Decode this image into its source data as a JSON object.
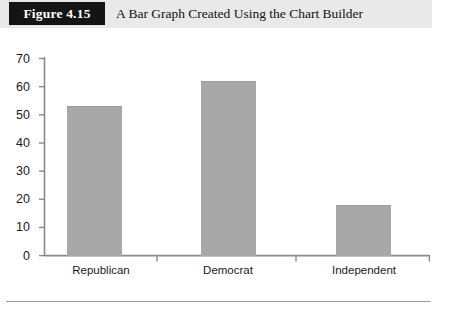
{
  "figure": {
    "number_label": "Figure 4.15",
    "title": "A Bar Graph Created Using the Chart Builder"
  },
  "colors": {
    "header_band": "#e9e9e9",
    "number_box": "#141414",
    "number_text": "#ffffff",
    "bar_fill": "#a8a8a8",
    "axis": "#808080",
    "text": "#1a1a1a"
  },
  "chart_data": {
    "type": "bar",
    "title": "A Bar Graph Created Using the Chart Builder",
    "xlabel": "",
    "ylabel": "",
    "categories": [
      "Republican",
      "Democrat",
      "Independent"
    ],
    "values": [
      53,
      62,
      18
    ],
    "ylim": [
      0,
      70
    ],
    "yticks": [
      0,
      10,
      20,
      30,
      40,
      50,
      60,
      70
    ],
    "ytick_labels": [
      "0",
      "10",
      "20",
      "30",
      "40",
      "50",
      "60",
      "70"
    ],
    "grid": false,
    "legend": null,
    "legend_position": "none",
    "orientation": "vertical"
  }
}
